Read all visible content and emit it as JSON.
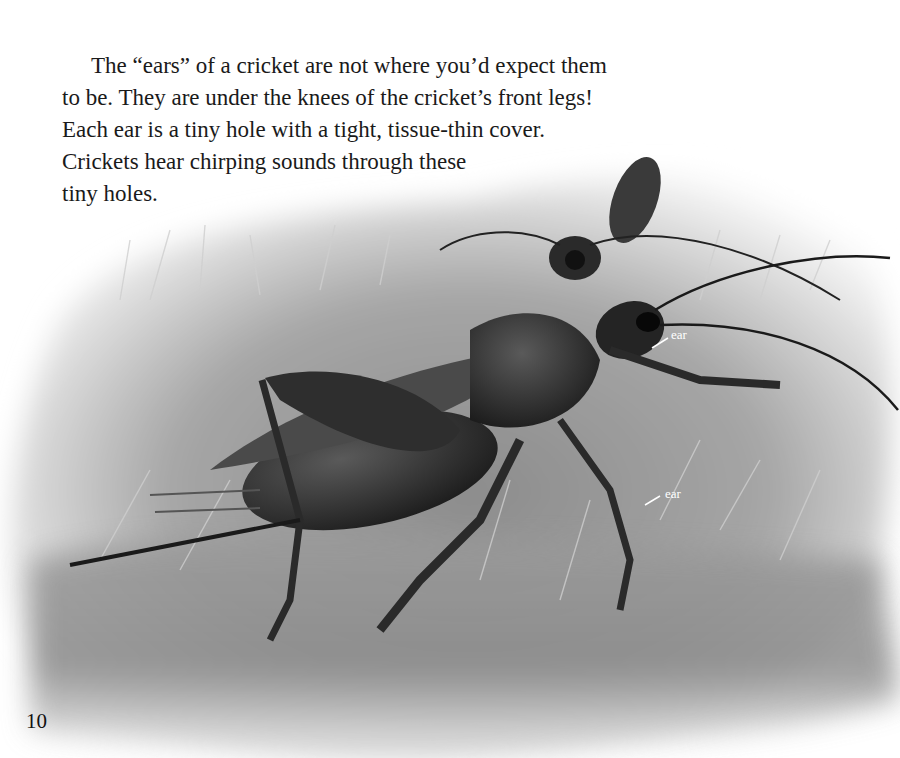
{
  "page": {
    "number": "10",
    "paragraph_lines": [
      "The “ears” of a cricket are not where you’d expect them",
      "to be. They are under the knees of the cricket’s front legs!",
      "Each ear is a tiny hole with a tight, tissue-thin cover.",
      "Crickets hear chirping sounds through these",
      "tiny holes."
    ]
  },
  "illustration": {
    "subject": "two crickets in grass, grayscale",
    "labels": [
      {
        "text": "ear",
        "target": "front leg knee (upper)"
      },
      {
        "text": "ear",
        "target": "front leg knee (lower)"
      }
    ]
  }
}
